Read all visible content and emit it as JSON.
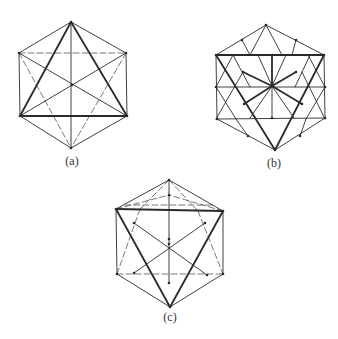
{
  "colors": {
    "background": "#ffffff",
    "stroke": "#2a2a2a",
    "thin_stroke": "#555555"
  },
  "figures": [
    {
      "id": "a",
      "label": "(a)",
      "label_pos": [
        72,
        161
      ],
      "thick": [
        [
          [
            71,
            22
          ],
          [
            20,
            116
          ]
        ],
        [
          [
            71,
            22
          ],
          [
            127,
            116
          ]
        ],
        [
          [
            20,
            116
          ],
          [
            127,
            116
          ]
        ]
      ],
      "solid": [
        [
          [
            71,
            22
          ],
          [
            19,
            53
          ]
        ],
        [
          [
            71,
            22
          ],
          [
            126,
            53
          ]
        ],
        [
          [
            19,
            53
          ],
          [
            20,
            116
          ]
        ],
        [
          [
            126,
            53
          ],
          [
            127,
            116
          ]
        ],
        [
          [
            20,
            116
          ],
          [
            71,
            148
          ]
        ],
        [
          [
            127,
            116
          ],
          [
            71,
            148
          ]
        ],
        [
          [
            71,
            22
          ],
          [
            71,
            148
          ]
        ],
        [
          [
            19,
            53
          ],
          [
            127,
            116
          ]
        ],
        [
          [
            126,
            53
          ],
          [
            20,
            116
          ]
        ]
      ],
      "dashed": [
        [
          [
            19,
            53
          ],
          [
            126,
            53
          ]
        ],
        [
          [
            19,
            53
          ],
          [
            71,
            148
          ]
        ],
        [
          [
            126,
            53
          ],
          [
            71,
            148
          ]
        ]
      ],
      "dots": [
        [
          71,
          22
        ],
        [
          19,
          53
        ],
        [
          126,
          53
        ],
        [
          20,
          116
        ],
        [
          127,
          116
        ],
        [
          71,
          148
        ],
        [
          72,
          85
        ]
      ]
    },
    {
      "id": "b",
      "label": "(b)",
      "label_pos": [
        274,
        163
      ],
      "thick": [
        [
          [
            216,
            55
          ],
          [
            324,
            55
          ]
        ],
        [
          [
            216,
            55
          ],
          [
            275,
            150
          ]
        ],
        [
          [
            324,
            55
          ],
          [
            275,
            150
          ]
        ],
        [
          [
            272,
            86
          ],
          [
            272,
            55
          ]
        ],
        [
          [
            272,
            86
          ],
          [
            244,
            104
          ]
        ],
        [
          [
            272,
            86
          ],
          [
            302,
            104
          ]
        ],
        [
          [
            272,
            86
          ],
          [
            243,
            72
          ]
        ],
        [
          [
            272,
            86
          ],
          [
            296,
            72
          ]
        ]
      ],
      "solid": [
        [
          [
            266,
            25
          ],
          [
            216,
            55
          ]
        ],
        [
          [
            266,
            25
          ],
          [
            324,
            55
          ]
        ],
        [
          [
            216,
            55
          ],
          [
            217,
            119
          ]
        ],
        [
          [
            324,
            55
          ],
          [
            325,
            118
          ]
        ],
        [
          [
            217,
            119
          ],
          [
            275,
            150
          ]
        ],
        [
          [
            325,
            118
          ],
          [
            275,
            150
          ]
        ],
        [
          [
            216,
            87
          ],
          [
            325,
            87
          ]
        ],
        [
          [
            217,
            119
          ],
          [
            325,
            118
          ]
        ],
        [
          [
            266,
            25
          ],
          [
            250,
            55
          ]
        ],
        [
          [
            266,
            25
          ],
          [
            282,
            55
          ]
        ],
        [
          [
            242,
            40
          ],
          [
            250,
            55
          ]
        ],
        [
          [
            296,
            40
          ],
          [
            292,
            55
          ]
        ],
        [
          [
            272,
            86
          ],
          [
            272,
            118
          ]
        ],
        [
          [
            272,
            86
          ],
          [
            258,
            55
          ]
        ],
        [
          [
            272,
            86
          ],
          [
            286,
            55
          ]
        ],
        [
          [
            272,
            86
          ],
          [
            250,
            118
          ]
        ],
        [
          [
            272,
            86
          ],
          [
            294,
            118
          ]
        ],
        [
          [
            216,
            87
          ],
          [
            233,
            55
          ]
        ],
        [
          [
            325,
            87
          ],
          [
            308,
            55
          ]
        ],
        [
          [
            216,
            87
          ],
          [
            236,
            119
          ]
        ],
        [
          [
            325,
            87
          ],
          [
            306,
            119
          ]
        ],
        [
          [
            243,
            72
          ],
          [
            216,
            119
          ]
        ],
        [
          [
            302,
            72
          ],
          [
            325,
            119
          ]
        ],
        [
          [
            233,
            55
          ],
          [
            250,
            87
          ]
        ],
        [
          [
            310,
            55
          ],
          [
            295,
            87
          ]
        ],
        [
          [
            236,
            119
          ],
          [
            248,
            136
          ]
        ],
        [
          [
            306,
            119
          ],
          [
            300,
            136
          ]
        ]
      ],
      "dashed": [],
      "dots": [
        [
          266,
          25
        ],
        [
          242,
          40
        ],
        [
          296,
          40
        ],
        [
          216,
          55
        ],
        [
          324,
          55
        ],
        [
          272,
          55
        ],
        [
          216,
          87
        ],
        [
          325,
          87
        ],
        [
          243,
          72
        ],
        [
          296,
          72
        ],
        [
          244,
          104
        ],
        [
          302,
          104
        ],
        [
          272,
          86
        ],
        [
          272,
          118
        ],
        [
          217,
          119
        ],
        [
          325,
          118
        ],
        [
          248,
          136
        ],
        [
          300,
          136
        ],
        [
          275,
          150
        ]
      ]
    },
    {
      "id": "c",
      "label": "(c)",
      "label_pos": [
        170,
        317
      ],
      "thick": [
        [
          [
            116,
            209
          ],
          [
            223,
            211
          ]
        ],
        [
          [
            116,
            209
          ],
          [
            170,
            307
          ]
        ],
        [
          [
            223,
            211
          ],
          [
            170,
            307
          ]
        ]
      ],
      "solid": [
        [
          [
            169,
            180
          ],
          [
            116,
            209
          ]
        ],
        [
          [
            169,
            180
          ],
          [
            223,
            211
          ]
        ],
        [
          [
            116,
            209
          ],
          [
            117,
            274
          ]
        ],
        [
          [
            223,
            211
          ],
          [
            223,
            274
          ]
        ],
        [
          [
            117,
            274
          ],
          [
            170,
            307
          ]
        ],
        [
          [
            223,
            274
          ],
          [
            170,
            307
          ]
        ],
        [
          [
            169,
            180
          ],
          [
            169,
            283
          ]
        ],
        [
          [
            134,
            223
          ],
          [
            207,
            275
          ]
        ],
        [
          [
            205,
            223
          ],
          [
            134,
            273
          ]
        ]
      ],
      "dashed": [
        [
          [
            169,
            180
          ],
          [
            140,
            209
          ]
        ],
        [
          [
            169,
            180
          ],
          [
            198,
            211
          ]
        ],
        [
          [
            125,
            205
          ],
          [
            214,
            205
          ]
        ],
        [
          [
            140,
            209
          ],
          [
            117,
            274
          ]
        ],
        [
          [
            198,
            211
          ],
          [
            223,
            274
          ]
        ],
        [
          [
            116,
            209
          ],
          [
            169,
            195
          ]
        ],
        [
          [
            223,
            211
          ],
          [
            169,
            195
          ]
        ],
        [
          [
            117,
            274
          ],
          [
            223,
            274
          ]
        ]
      ],
      "dots": [
        [
          169,
          180
        ],
        [
          169,
          195
        ],
        [
          116,
          209
        ],
        [
          223,
          211
        ],
        [
          134,
          223
        ],
        [
          205,
          223
        ],
        [
          169,
          239
        ],
        [
          169,
          244
        ],
        [
          134,
          273
        ],
        [
          207,
          275
        ],
        [
          117,
          274
        ],
        [
          223,
          274
        ],
        [
          169,
          283
        ],
        [
          170,
          307
        ]
      ]
    }
  ]
}
